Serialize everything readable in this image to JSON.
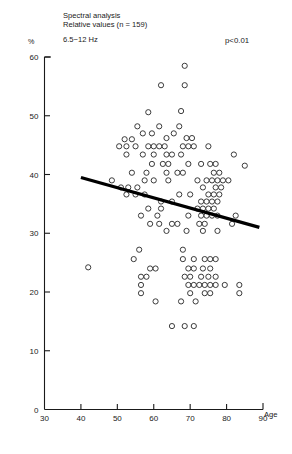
{
  "header": {
    "title_line1": "Spectral analysis",
    "title_line2": "Relative values (n = 159)",
    "band": "6.5−12 Hz",
    "pvalue": "p<0.01"
  },
  "axes": {
    "y_unit": "%",
    "x_caption": "Age",
    "x_ticks": [
      "30",
      "40",
      "50",
      "60",
      "70",
      "80",
      "90"
    ],
    "y_ticks": [
      "0",
      "10",
      "20",
      "30",
      "40",
      "50",
      "60"
    ]
  },
  "chart_data": {
    "type": "scatter",
    "xlabel": "Age",
    "ylabel": "%",
    "xlim": [
      30,
      90
    ],
    "ylim": [
      0,
      60
    ],
    "grid": false,
    "legend": false,
    "annotations": [
      "p<0.01"
    ],
    "n": 159,
    "marker": "open-circle",
    "trendline": {
      "type": "linear-regression",
      "x_start": 40.0,
      "y_start": 39.5,
      "x_end": 89.0,
      "y_end": 31.0
    },
    "points": [
      [
        68.5,
        58.5
      ],
      [
        62.0,
        55.2
      ],
      [
        68.5,
        55.2
      ],
      [
        58.5,
        50.6
      ],
      [
        67.5,
        50.8
      ],
      [
        55.5,
        48.2
      ],
      [
        61.5,
        48.2
      ],
      [
        67.0,
        48.2
      ],
      [
        57.0,
        47.0
      ],
      [
        59.5,
        47.0
      ],
      [
        65.5,
        47.0
      ],
      [
        52.0,
        46.0
      ],
      [
        54.0,
        46.0
      ],
      [
        63.5,
        46.2
      ],
      [
        69.0,
        46.2
      ],
      [
        70.5,
        46.2
      ],
      [
        50.5,
        44.8
      ],
      [
        52.5,
        44.8
      ],
      [
        55.0,
        44.8
      ],
      [
        58.5,
        44.8
      ],
      [
        60.0,
        44.8
      ],
      [
        61.5,
        44.8
      ],
      [
        63.0,
        44.8
      ],
      [
        68.0,
        44.8
      ],
      [
        69.5,
        44.8
      ],
      [
        71.0,
        44.8
      ],
      [
        75.0,
        44.8
      ],
      [
        52.5,
        43.4
      ],
      [
        57.0,
        43.4
      ],
      [
        60.0,
        43.4
      ],
      [
        63.5,
        43.4
      ],
      [
        65.0,
        43.4
      ],
      [
        67.5,
        43.4
      ],
      [
        82.0,
        43.4
      ],
      [
        59.5,
        41.8
      ],
      [
        62.5,
        41.8
      ],
      [
        64.0,
        41.8
      ],
      [
        69.5,
        41.8
      ],
      [
        73.0,
        41.8
      ],
      [
        75.5,
        41.8
      ],
      [
        77.0,
        41.8
      ],
      [
        85.0,
        41.5
      ],
      [
        54.0,
        40.3
      ],
      [
        58.0,
        40.3
      ],
      [
        63.5,
        40.3
      ],
      [
        66.5,
        40.3
      ],
      [
        68.0,
        40.3
      ],
      [
        76.5,
        40.3
      ],
      [
        78.0,
        40.3
      ],
      [
        48.5,
        39.0
      ],
      [
        57.5,
        39.0
      ],
      [
        60.0,
        39.0
      ],
      [
        64.0,
        39.0
      ],
      [
        72.0,
        39.0
      ],
      [
        74.5,
        39.0
      ],
      [
        76.0,
        39.0
      ],
      [
        77.5,
        39.0
      ],
      [
        79.0,
        39.0
      ],
      [
        80.5,
        39.0
      ],
      [
        51.0,
        37.8
      ],
      [
        53.0,
        37.8
      ],
      [
        55.5,
        37.8
      ],
      [
        73.5,
        37.8
      ],
      [
        77.0,
        37.8
      ],
      [
        78.5,
        37.8
      ],
      [
        52.5,
        36.6
      ],
      [
        55.0,
        36.6
      ],
      [
        57.5,
        36.6
      ],
      [
        67.0,
        36.6
      ],
      [
        70.0,
        36.6
      ],
      [
        75.0,
        36.6
      ],
      [
        76.5,
        36.6
      ],
      [
        78.0,
        36.6
      ],
      [
        62.0,
        35.4
      ],
      [
        65.0,
        35.4
      ],
      [
        73.0,
        35.4
      ],
      [
        74.5,
        35.4
      ],
      [
        76.0,
        35.4
      ],
      [
        77.5,
        35.4
      ],
      [
        58.5,
        34.2
      ],
      [
        62.0,
        34.2
      ],
      [
        72.0,
        34.2
      ],
      [
        73.5,
        34.2
      ],
      [
        75.0,
        34.2
      ],
      [
        76.5,
        34.2
      ],
      [
        56.5,
        33.0
      ],
      [
        61.0,
        33.0
      ],
      [
        69.5,
        33.0
      ],
      [
        73.0,
        33.0
      ],
      [
        74.5,
        33.0
      ],
      [
        76.0,
        33.0
      ],
      [
        77.5,
        33.0
      ],
      [
        82.5,
        33.0
      ],
      [
        59.0,
        31.6
      ],
      [
        61.5,
        31.6
      ],
      [
        65.0,
        31.6
      ],
      [
        66.5,
        31.6
      ],
      [
        72.5,
        31.6
      ],
      [
        74.0,
        31.6
      ],
      [
        81.5,
        31.6
      ],
      [
        63.5,
        30.4
      ],
      [
        69.0,
        30.4
      ],
      [
        73.5,
        30.4
      ],
      [
        77.5,
        30.4
      ],
      [
        42.0,
        24.2
      ],
      [
        56.0,
        27.2
      ],
      [
        68.0,
        27.2
      ],
      [
        54.5,
        25.6
      ],
      [
        68.0,
        25.6
      ],
      [
        71.0,
        25.6
      ],
      [
        74.0,
        25.6
      ],
      [
        75.5,
        25.6
      ],
      [
        77.0,
        25.6
      ],
      [
        59.0,
        24.0
      ],
      [
        60.5,
        24.0
      ],
      [
        69.5,
        24.0
      ],
      [
        71.0,
        24.0
      ],
      [
        73.5,
        24.0
      ],
      [
        75.5,
        24.0
      ],
      [
        56.5,
        22.6
      ],
      [
        58.0,
        22.6
      ],
      [
        68.5,
        22.6
      ],
      [
        70.0,
        22.6
      ],
      [
        73.0,
        22.6
      ],
      [
        75.0,
        22.6
      ],
      [
        77.0,
        22.6
      ],
      [
        56.5,
        21.2
      ],
      [
        69.5,
        21.2
      ],
      [
        71.0,
        21.2
      ],
      [
        72.5,
        21.2
      ],
      [
        74.0,
        21.2
      ],
      [
        75.5,
        21.2
      ],
      [
        77.0,
        21.2
      ],
      [
        79.5,
        21.2
      ],
      [
        83.5,
        21.2
      ],
      [
        56.5,
        19.8
      ],
      [
        70.0,
        19.8
      ],
      [
        74.0,
        19.8
      ],
      [
        75.5,
        19.8
      ],
      [
        83.5,
        19.8
      ],
      [
        60.5,
        18.4
      ],
      [
        67.5,
        18.4
      ],
      [
        71.5,
        18.4
      ],
      [
        65.0,
        14.2
      ],
      [
        68.5,
        14.2
      ],
      [
        71.0,
        14.2
      ]
    ]
  }
}
